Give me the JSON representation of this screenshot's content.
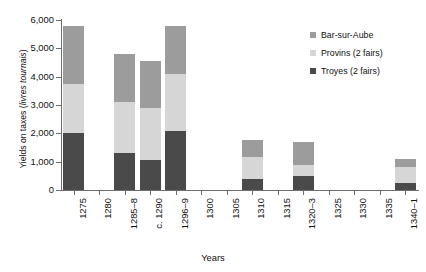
{
  "chart_data": {
    "type": "bar",
    "stacked": true,
    "title": "",
    "xlabel": "Years",
    "ylabel": "Yields on taxes (livres tournais)",
    "ylabel_plain": "Yields on taxes (",
    "ylabel_italic": "livres tournais",
    "ylabel_tail": ")",
    "categories": [
      "1275",
      "1280",
      "1285–8",
      "c. 1290",
      "1296–9",
      "1300",
      "1305",
      "1310",
      "1315",
      "1320–3",
      "1325",
      "1330",
      "1335",
      "1340–1"
    ],
    "ylim": [
      0,
      6000
    ],
    "yticks": [
      0,
      1000,
      2000,
      3000,
      4000,
      5000,
      6000
    ],
    "ytick_labels": [
      "0",
      "1,000",
      "2,000",
      "3,000",
      "4,000",
      "5,000",
      "6,000"
    ],
    "grid": false,
    "legend_position": "top-right",
    "series": [
      {
        "name": "Troyes (2 fairs)",
        "color": "#4a4a4a",
        "values": [
          2000,
          0,
          1300,
          1050,
          2100,
          0,
          0,
          400,
          0,
          500,
          0,
          0,
          0,
          250
        ]
      },
      {
        "name": "Provins (2 fairs)",
        "color": "#d6d6d6",
        "values": [
          1750,
          0,
          1800,
          1850,
          2000,
          0,
          0,
          750,
          0,
          400,
          0,
          0,
          0,
          550
        ]
      },
      {
        "name": "Bar-sur-Aube",
        "color": "#9c9c9c",
        "values": [
          2050,
          0,
          1700,
          1650,
          1700,
          0,
          0,
          600,
          0,
          800,
          0,
          0,
          0,
          300
        ]
      }
    ],
    "totals": [
      5800,
      0,
      4800,
      4550,
      5800,
      0,
      0,
      1750,
      0,
      1700,
      0,
      0,
      0,
      1100
    ],
    "legend_order": [
      "Bar-sur-Aube",
      "Provins (2 fairs)",
      "Troyes (2 fairs)"
    ]
  }
}
